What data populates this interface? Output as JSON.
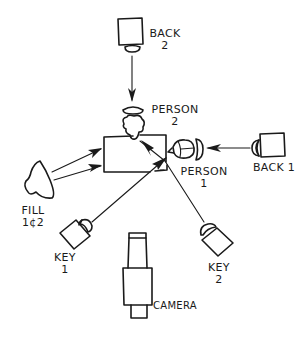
{
  "diagram": {
    "labels": {
      "back2": {
        "line1": "BACK",
        "line2": "2"
      },
      "person2": {
        "line1": "PERSON",
        "line2": "2"
      },
      "person1": {
        "line1": "PERSON",
        "line2": "1"
      },
      "back1": {
        "line1": "BACK 1"
      },
      "fill": {
        "line1": "FILL",
        "line2": "1¢2"
      },
      "key1": {
        "line1": "KEY",
        "line2": "1"
      },
      "key2": {
        "line1": "KEY",
        "line2": "2"
      },
      "camera": {
        "line1": "CAMERA"
      }
    },
    "nodes": [
      {
        "id": "back2",
        "type": "light",
        "direction": "down"
      },
      {
        "id": "back1",
        "type": "light",
        "direction": "left"
      },
      {
        "id": "fill",
        "type": "light",
        "direction": "right"
      },
      {
        "id": "key1",
        "type": "light",
        "direction": "up-right"
      },
      {
        "id": "key2",
        "type": "light",
        "direction": "up-left"
      },
      {
        "id": "person1",
        "type": "person"
      },
      {
        "id": "person2",
        "type": "person"
      },
      {
        "id": "table",
        "type": "table"
      },
      {
        "id": "camera",
        "type": "camera"
      }
    ],
    "edges": [
      {
        "from": "back2",
        "to": "person2"
      },
      {
        "from": "back1",
        "to": "person1"
      },
      {
        "from": "fill",
        "to": "table",
        "count": 2
      },
      {
        "from": "key1",
        "to": "person1"
      },
      {
        "from": "key2",
        "to": "person2"
      }
    ],
    "colors": {
      "ink": "#1a1a1a",
      "background": "#ffffff"
    }
  }
}
